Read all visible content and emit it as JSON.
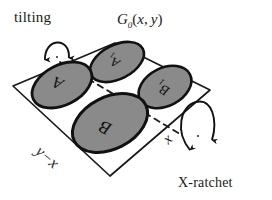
{
  "figure": {
    "title_label": "G_0(x,y)",
    "plate": {
      "name": "tilted-plate",
      "outline_color": "#1a1a1a",
      "fill_color": "#ffffff",
      "corners": [
        [
          115,
          43
        ],
        [
          210,
          90
        ],
        [
          110,
          176
        ],
        [
          13,
          86
        ]
      ]
    },
    "dashed_diagonal": {
      "from": [
        60,
        62
      ],
      "to": [
        178,
        133
      ],
      "style": "dashed"
    },
    "discs": [
      {
        "id": "A1",
        "label": "A",
        "subscript": "1",
        "cx": 117,
        "cy": 62,
        "rx": 29,
        "ry": 17,
        "rotation": -27,
        "fill": "#8a8a8a",
        "stroke": "#111111"
      },
      {
        "id": "A",
        "label": "A",
        "subscript": "",
        "cx": 62,
        "cy": 85,
        "rx": 32,
        "ry": 20,
        "rotation": -27,
        "fill": "#8a8a8a",
        "stroke": "#111111"
      },
      {
        "id": "B1",
        "label": "B",
        "subscript": "1",
        "cx": 165,
        "cy": 87,
        "rx": 28,
        "ry": 19,
        "rotation": -27,
        "fill": "#8a8a8a",
        "stroke": "#111111"
      },
      {
        "id": "B",
        "label": "B",
        "subscript": "",
        "cx": 110,
        "cy": 123,
        "rx": 40,
        "ry": 26,
        "rotation": -27,
        "fill": "#8a8a8a",
        "stroke": "#111111"
      }
    ],
    "edge_labels": [
      {
        "id": "y-minus-x",
        "text": "y−x",
        "position": "lower-left-edge"
      },
      {
        "id": "x",
        "text": "x",
        "position": "lower-right-edge"
      }
    ],
    "annotations": [
      {
        "id": "tilting",
        "text": "tilting",
        "arrow": "double-headed-rotation-arc",
        "position": "upper-left"
      },
      {
        "id": "x-ratchet",
        "text": "X-ratchet",
        "arrow": "double-headed-rotation-ellipse",
        "position": "lower-right"
      }
    ],
    "colors": {
      "ink": "#1a1a1a",
      "disc_fill": "#8a8a8a",
      "disc_stroke": "#111111",
      "background": "#ffffff"
    }
  }
}
